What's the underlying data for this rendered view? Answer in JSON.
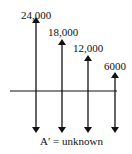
{
  "diagram": {
    "type": "cash-flow-diagram",
    "receipts": [
      {
        "label": "24,000",
        "value": 24000
      },
      {
        "label": "18,000",
        "value": 18000
      },
      {
        "label": "12,000",
        "value": 12000
      },
      {
        "label": "6000",
        "value": 6000
      }
    ],
    "payments": {
      "count": 4,
      "label": "A′ = unknown"
    },
    "colors": {
      "ink": "#111111",
      "background": "#ffffff"
    }
  }
}
